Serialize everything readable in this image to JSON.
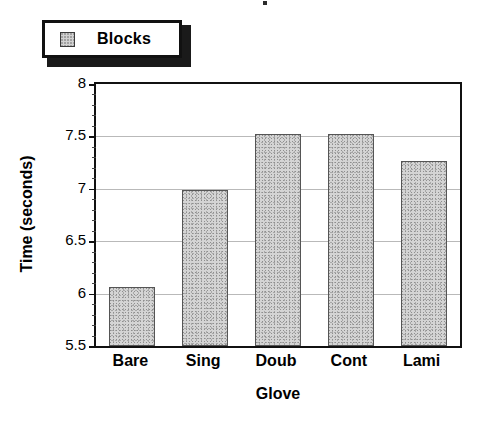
{
  "legend": {
    "entries": [
      {
        "label": "Blocks",
        "swatch": "stippled-gray-swatch"
      }
    ]
  },
  "chart_data": {
    "type": "bar",
    "title": "",
    "categories": [
      "Bare",
      "Sing",
      "Doub",
      "Cont",
      "Lami"
    ],
    "values": [
      6.06,
      6.99,
      7.52,
      7.52,
      7.27
    ],
    "series": [
      {
        "name": "Blocks",
        "values": [
          6.06,
          6.99,
          7.52,
          7.52,
          7.27
        ]
      }
    ],
    "xlabel": "Glove",
    "ylabel": "Time (seconds)",
    "ylim": [
      5.5,
      8
    ],
    "yticks": [
      5.5,
      6,
      6.5,
      7,
      7.5,
      8
    ],
    "ytick_labels": [
      "5.5",
      "6",
      "6.5",
      "7",
      "7.5",
      "8"
    ],
    "minor_ticks_per_interval": 4,
    "grid": true,
    "grid_axis": "y",
    "legend_position": "above-plot-left",
    "bar_fill": "#d4d4d4",
    "bar_edge": "#555555",
    "grid_color": "#b9b9b9",
    "frame_color": "#111111"
  }
}
